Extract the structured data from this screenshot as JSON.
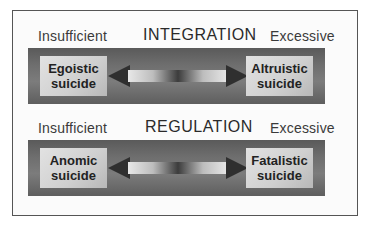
{
  "diagram": {
    "rows": [
      {
        "title": "INTEGRATION",
        "left_label": "Insufficient",
        "right_label": "Excessive",
        "left_box": [
          "Egoistic",
          "suicide"
        ],
        "right_box": [
          "Altruistic",
          "suicide"
        ]
      },
      {
        "title": "REGULATION",
        "left_label": "Insufficient",
        "right_label": "Excessive",
        "left_box": [
          "Anomic",
          "suicide"
        ],
        "right_box": [
          "Fatalistic",
          "suicide"
        ]
      }
    ]
  }
}
